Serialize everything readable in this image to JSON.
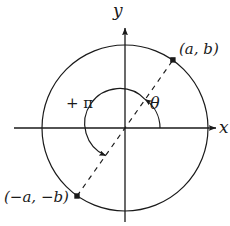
{
  "figure": {
    "background_color": "#ffffff",
    "stroke_color": "#1a1a1a",
    "axes": {
      "x_label": "x",
      "y_label": "y",
      "origin": {
        "x": 125,
        "y": 128
      }
    },
    "circles": {
      "outer": {
        "cx": 125,
        "cy": 128,
        "r": 83
      },
      "inner_arc": {
        "cx": 125,
        "cy": 128,
        "r": 35
      }
    },
    "angles": {
      "theta_label": "θ",
      "theta_degrees": 55,
      "pi_label": "+ π",
      "pi_symbol": "π",
      "pi_sign": "+"
    },
    "points": [
      {
        "name": "point-ab",
        "label": "(a, b)",
        "x": 173,
        "y": 60,
        "on_circle": true
      },
      {
        "name": "point-neg-a-neg-b",
        "label": "(−a, −b)",
        "x": 77,
        "y": 196,
        "on_circle": true
      }
    ],
    "dashed_line": {
      "from": "(−a, −b)",
      "to": "(a, b)",
      "style": "dashed",
      "passes_through_origin": true
    }
  }
}
